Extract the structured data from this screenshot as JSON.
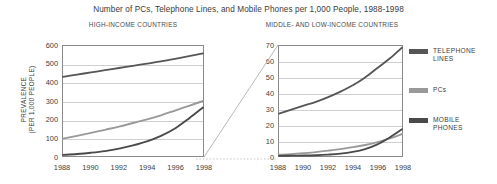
{
  "figure": {
    "title": "Number of PCs, Telephone Lines, and Mobile Phones per 1,000 People, 1988-1998",
    "panel_titles": {
      "left": "HIGH-INCOME COUNTRIES",
      "right": "MIDDLE- AND LOW-INCOME COUNTRIES"
    },
    "y_axis_title_line1": "PREVALENCE",
    "y_axis_title_line2": "(PER 1,000 PEOPLE)"
  },
  "legend": {
    "position": "right",
    "entries": [
      {
        "label": "TELEPHONE\nLINES",
        "color": "#565656"
      },
      {
        "label": "PCs",
        "color": "#999999"
      },
      {
        "label": "MOBILE\nPHONES",
        "color": "#4a4a4a"
      }
    ]
  },
  "colors": {
    "telephone_lines": "#565656",
    "pcs": "#999999",
    "mobile_phones": "#4a4a4a",
    "frame": "#8a8a8a",
    "gridline": "#cfcfcf",
    "text": "#3d3d3d"
  },
  "chart_data": [
    {
      "type": "line",
      "title": "HIGH-INCOME COUNTRIES",
      "xlabel": "",
      "ylabel": "PREVALENCE (PER 1,000 PEOPLE)",
      "x": [
        1988,
        1989,
        1990,
        1991,
        1992,
        1993,
        1994,
        1995,
        1996,
        1997,
        1998
      ],
      "xtick_labels": [
        "1988",
        "1990",
        "1992",
        "1994",
        "1996",
        "1998"
      ],
      "xlim": [
        1988,
        1998
      ],
      "ylim": [
        0,
        600
      ],
      "yticks": [
        0,
        100,
        200,
        300,
        400,
        500,
        600
      ],
      "grid": true,
      "series": [
        {
          "name": "TELEPHONE LINES",
          "color": "#565656",
          "values": [
            432,
            444,
            456,
            468,
            480,
            492,
            504,
            516,
            530,
            545,
            560
          ]
        },
        {
          "name": "PCs",
          "color": "#999999",
          "values": [
            95,
            110,
            126,
            143,
            160,
            180,
            200,
            222,
            248,
            274,
            300
          ]
        },
        {
          "name": "MOBILE PHONES",
          "color": "#4a4a4a",
          "values": [
            6,
            11,
            18,
            27,
            40,
            58,
            80,
            110,
            150,
            205,
            265
          ]
        }
      ]
    },
    {
      "type": "line",
      "title": "MIDDLE- AND LOW-INCOME COUNTRIES",
      "xlabel": "",
      "ylabel": "",
      "x": [
        1988,
        1989,
        1990,
        1991,
        1992,
        1993,
        1994,
        1995,
        1996,
        1997,
        1998
      ],
      "xtick_labels": [
        "1988",
        "1990",
        "1992",
        "1994",
        "1996",
        "1998"
      ],
      "xlim": [
        1988,
        1998
      ],
      "ylim": [
        0,
        70
      ],
      "yticks": [
        0,
        10,
        20,
        30,
        40,
        50,
        60,
        70
      ],
      "grid": true,
      "series": [
        {
          "name": "TELEPHONE LINES",
          "color": "#565656",
          "values": [
            27,
            29.5,
            32,
            34.5,
            37.5,
            41,
            45,
            50,
            56,
            62,
            69
          ]
        },
        {
          "name": "PCs",
          "color": "#999999",
          "values": [
            0.8,
            1.2,
            1.8,
            2.5,
            3.4,
            4.4,
            5.6,
            7.0,
            8.8,
            11.2,
            14.0
          ]
        },
        {
          "name": "MOBILE PHONES",
          "color": "#4a4a4a",
          "values": [
            0.1,
            0.2,
            0.3,
            0.5,
            0.9,
            1.5,
            2.6,
            4.4,
            7.4,
            11.8,
            17.0
          ]
        }
      ]
    }
  ]
}
